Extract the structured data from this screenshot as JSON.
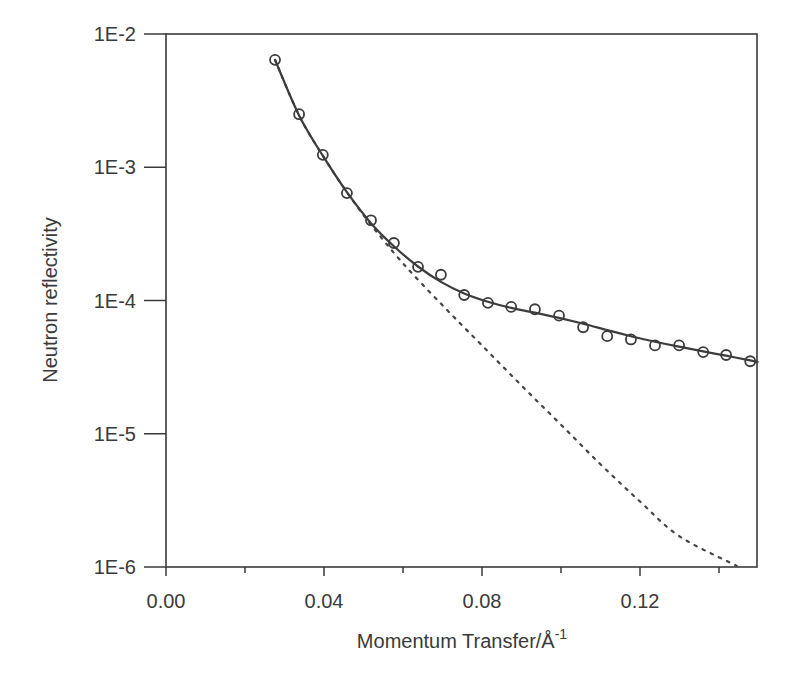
{
  "chart_data": {
    "type": "scatter",
    "title": "",
    "xlabel": "Momentum Transfer/Å-1",
    "xlabel_base": "Momentum Transfer/Å",
    "xlabel_sup": "-1",
    "ylabel": "Neutron reflectivity",
    "xlim": [
      0.0,
      0.15
    ],
    "ylim": [
      1e-06,
      0.01
    ],
    "yscale": "log",
    "grid": false,
    "legend": null,
    "x_ticks": [
      {
        "value": 0.0,
        "label": "0.00"
      },
      {
        "value": 0.04,
        "label": "0.04"
      },
      {
        "value": 0.08,
        "label": "0.08"
      },
      {
        "value": 0.12,
        "label": "0.12"
      }
    ],
    "x_minor_ticks": [
      0.02,
      0.06,
      0.1,
      0.14
    ],
    "y_ticks": [
      {
        "value": 0.01,
        "label": "1E-2"
      },
      {
        "value": 0.001,
        "label": "1E-3"
      },
      {
        "value": 0.0001,
        "label": "1E-4"
      },
      {
        "value": 1e-05,
        "label": "1E-5"
      },
      {
        "value": 1e-06,
        "label": "1E-6"
      }
    ],
    "series": [
      {
        "name": "Measured data",
        "style": "open-circle",
        "x": [
          0.0276,
          0.0337,
          0.0397,
          0.0458,
          0.0519,
          0.0577,
          0.0638,
          0.0696,
          0.0755,
          0.0815,
          0.0874,
          0.0934,
          0.0995,
          0.1056,
          0.1117,
          0.1177,
          0.1238,
          0.1299,
          0.136,
          0.1418,
          0.1479
        ],
        "y": [
          0.0064,
          0.0025,
          0.00124,
          0.00064,
          0.0004,
          0.00027,
          0.000179,
          0.000156,
          0.00011,
          9.6e-05,
          8.95e-05,
          8.6e-05,
          7.7e-05,
          6.3e-05,
          5.4e-05,
          5.1e-05,
          4.6e-05,
          4.6e-05,
          4.1e-05,
          3.9e-05,
          3.5e-05
        ]
      },
      {
        "name": "Model fit",
        "style": "solid-line",
        "x": [
          0.0276,
          0.0337,
          0.0397,
          0.0458,
          0.0519,
          0.0577,
          0.0638,
          0.0696,
          0.0755,
          0.0815,
          0.0874,
          0.0934,
          0.0995,
          0.1056,
          0.1117,
          0.1177,
          0.1238,
          0.1299,
          0.136,
          0.1418,
          0.1479,
          0.15
        ],
        "y": [
          0.0064,
          0.00245,
          0.00122,
          0.00065,
          0.00038,
          0.000255,
          0.00018,
          0.000138,
          0.000113,
          9.8e-05,
          8.8e-05,
          8.1e-05,
          7.4e-05,
          6.7e-05,
          6e-05,
          5.4e-05,
          4.9e-05,
          4.5e-05,
          4.15e-05,
          3.85e-05,
          3.55e-05,
          3.45e-05
        ]
      },
      {
        "name": "Bare substrate (Fresnel)",
        "style": "dotted-line",
        "x": [
          0.0276,
          0.0337,
          0.0397,
          0.0458,
          0.0519,
          0.06,
          0.07,
          0.08,
          0.09,
          0.1,
          0.11,
          0.12,
          0.13,
          0.1445
        ],
        "y": [
          0.0064,
          0.00245,
          0.00122,
          0.00065,
          0.00037,
          0.00019,
          9.2e-05,
          4.6e-05,
          2.3e-05,
          1.17e-05,
          5.9e-06,
          3.1e-06,
          1.7e-06,
          1.02e-06
        ]
      }
    ]
  }
}
